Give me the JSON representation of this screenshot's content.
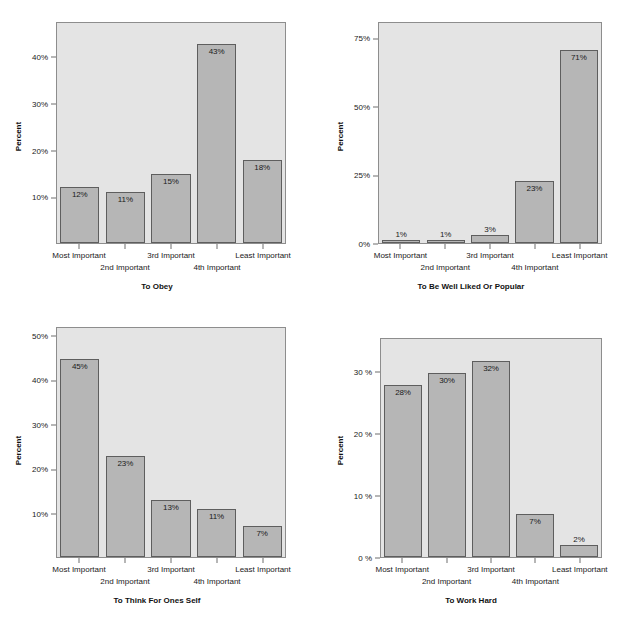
{
  "figure": {
    "layout": "2x2 grid of bar charts",
    "background_color": "#ffffff",
    "plot_background_color": "#e4e4e4",
    "bar_fill_color": "#b6b6b6",
    "bar_border_color": "#5e5e5e",
    "categories": [
      "Most Important",
      "2nd Important",
      "3rd Important",
      "4th Important",
      "Least Important"
    ]
  },
  "chart_data": [
    {
      "type": "bar",
      "id": "to-obey",
      "title": "To Obey",
      "xlabel": "",
      "ylabel": "Percent",
      "categories": [
        "Most Important",
        "2nd Important",
        "3rd Important",
        "4th Important",
        "Least Important"
      ],
      "values": [
        12,
        11,
        15,
        43,
        18
      ],
      "data_labels": [
        "12%",
        "11%",
        "15%",
        "43%",
        "18%"
      ],
      "yticks": [
        10,
        20,
        30,
        40
      ],
      "ytick_labels": [
        "10%",
        "20%",
        "30%",
        "40%"
      ],
      "ylim": [
        0,
        47.5
      ],
      "grid": false
    },
    {
      "type": "bar",
      "id": "to-be-well-liked-or-popular",
      "title": "To Be Well Liked Or Popular",
      "xlabel": "",
      "ylabel": "Percent",
      "categories": [
        "Most Important",
        "2nd Important",
        "3rd Important",
        "4th Important",
        "Least Important"
      ],
      "values": [
        1,
        1,
        3,
        23,
        71
      ],
      "data_labels": [
        "1%",
        "1%",
        "3%",
        "23%",
        "71%"
      ],
      "yticks": [
        0,
        25,
        50,
        75
      ],
      "ytick_labels": [
        "0%",
        "25%",
        "50%",
        "75%"
      ],
      "ylim": [
        0,
        81
      ],
      "grid": false
    },
    {
      "type": "bar",
      "id": "to-think-for-ones-self",
      "title": "To Think For Ones Self",
      "xlabel": "",
      "ylabel": "Percent",
      "categories": [
        "Most Important",
        "2nd Important",
        "3rd Important",
        "4th Important",
        "Least Important"
      ],
      "values": [
        45,
        23,
        13,
        11,
        7
      ],
      "data_labels": [
        "45%",
        "23%",
        "13%",
        "11%",
        "7%"
      ],
      "yticks": [
        10,
        20,
        30,
        40,
        50
      ],
      "ytick_labels": [
        "10%",
        "20%",
        "30%",
        "40%",
        "50%"
      ],
      "ylim": [
        0,
        52
      ],
      "grid": false
    },
    {
      "type": "bar",
      "id": "to-work-hard",
      "title": "To Work Hard",
      "xlabel": "",
      "ylabel": "Percent",
      "categories": [
        "Most Important",
        "2nd Important",
        "3rd Important",
        "4th Important",
        "Least Important"
      ],
      "values": [
        28,
        30,
        32,
        7,
        2
      ],
      "data_labels": [
        "28%",
        "30%",
        "32%",
        "7%",
        "2%"
      ],
      "yticks": [
        0,
        10,
        20,
        30
      ],
      "ytick_labels": [
        "0 %",
        "10 %",
        "20 %",
        "30 %"
      ],
      "ylim": [
        0,
        35.5
      ],
      "grid": false
    }
  ]
}
